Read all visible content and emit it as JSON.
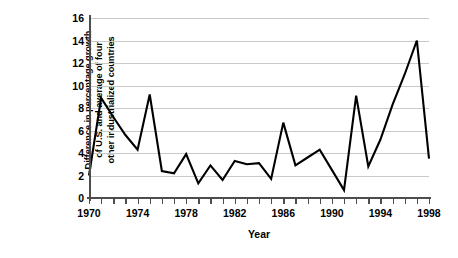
{
  "chart_data": {
    "type": "line",
    "title": "",
    "xlabel": "Year",
    "ylabel": "Difference in percentage growth\nof U.S. and average of four\nother industrialized countries",
    "xlim": [
      1970,
      1998
    ],
    "ylim": [
      0,
      16
    ],
    "y_ticks": [
      0,
      2,
      4,
      6,
      8,
      10,
      12,
      14,
      16
    ],
    "x_tick_labels": [
      1970,
      1974,
      1978,
      1982,
      1986,
      1990,
      1994,
      1998
    ],
    "x_minor_tick_step": 1,
    "grid": "horizontal",
    "legend": "none",
    "line_color": "#000000",
    "grid_color": "#c9c9c9",
    "axis_color": "#4d4d4d",
    "x": [
      1970,
      1971,
      1972,
      1973,
      1974,
      1975,
      1976,
      1977,
      1978,
      1979,
      1980,
      1981,
      1982,
      1983,
      1984,
      1985,
      1986,
      1987,
      1988,
      1989,
      1990,
      1991,
      1992,
      1993,
      1994,
      1995,
      1996,
      1997,
      1998
    ],
    "values": [
      2.0,
      8.9,
      7.2,
      5.6,
      4.3,
      9.2,
      2.4,
      2.2,
      3.9,
      1.3,
      2.9,
      1.6,
      3.3,
      3.0,
      3.1,
      1.7,
      6.7,
      2.9,
      3.6,
      4.3,
      2.5,
      0.7,
      9.1,
      2.8,
      5.2,
      8.3,
      11.0,
      14.0,
      3.5
    ],
    "series": [
      {
        "name": "U.S. minus four-country average growth difference",
        "values": [
          2.0,
          8.9,
          7.2,
          5.6,
          4.3,
          9.2,
          2.4,
          2.2,
          3.9,
          1.3,
          2.9,
          1.6,
          3.3,
          3.0,
          3.1,
          1.7,
          6.7,
          2.9,
          3.6,
          4.3,
          2.5,
          0.7,
          9.1,
          2.8,
          5.2,
          8.3,
          11.0,
          14.0,
          3.5
        ]
      }
    ]
  }
}
